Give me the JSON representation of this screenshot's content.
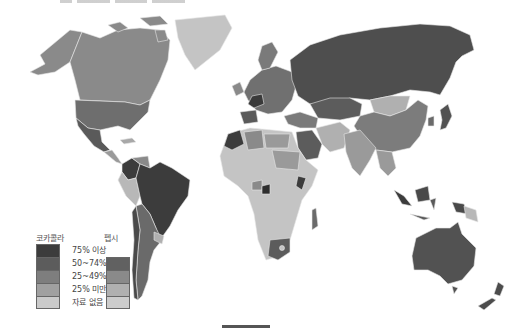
{
  "title": "",
  "legend": {
    "cocacola_label": "코카콜라",
    "pepsi_label": "펩시",
    "categories": [
      {
        "label": "75% 이상",
        "coke_color": "#3c3c3c",
        "pepsi_color": null
      },
      {
        "label": "50~74%",
        "coke_color": "#5c5c5c",
        "pepsi_color": "#616161"
      },
      {
        "label": "25~49%",
        "coke_color": "#7e7e7e",
        "pepsi_color": "#8a8a8a"
      },
      {
        "label": "25% 미만",
        "coke_color": "#a0a0a0",
        "pepsi_color": "#b0b0b0"
      },
      {
        "label": "자료 없음",
        "coke_color": "#cacaca",
        "pepsi_color": "#cccccc"
      }
    ]
  },
  "map_regions": [
    {
      "name": "Alaska",
      "shade": "#8a8a8a"
    },
    {
      "name": "Canada",
      "shade": "#8a8a8a"
    },
    {
      "name": "Greenland",
      "shade": "#c4c4c4"
    },
    {
      "name": "United States",
      "shade": "#6e6e6e"
    },
    {
      "name": "Mexico",
      "shade": "#5a5a5a"
    },
    {
      "name": "Brazil",
      "shade": "#3c3c3c"
    },
    {
      "name": "Colombia",
      "shade": "#3c3c3c"
    },
    {
      "name": "Argentina",
      "shade": "#6a6a6a"
    },
    {
      "name": "Peru",
      "shade": "#b8b8b8"
    },
    {
      "name": "Russia",
      "shade": "#4e4e4e"
    },
    {
      "name": "China",
      "shade": "#7c7c7c"
    },
    {
      "name": "Mongolia",
      "shade": "#b0b0b0"
    },
    {
      "name": "Kazakhstan",
      "shade": "#5c5c5c"
    },
    {
      "name": "Africa",
      "shade": "#c4c4c4"
    },
    {
      "name": "South Africa",
      "shade": "#5c5c5c"
    },
    {
      "name": "Australia",
      "shade": "#525252"
    },
    {
      "name": "New Zealand",
      "shade": "#4c4c4c"
    },
    {
      "name": "India",
      "shade": "#9a9a9a"
    },
    {
      "name": "Saudi Arabia",
      "shade": "#5c5c5c"
    },
    {
      "name": "Europe",
      "shade": "#707070"
    },
    {
      "name": "Japan",
      "shade": "#525252"
    }
  ]
}
